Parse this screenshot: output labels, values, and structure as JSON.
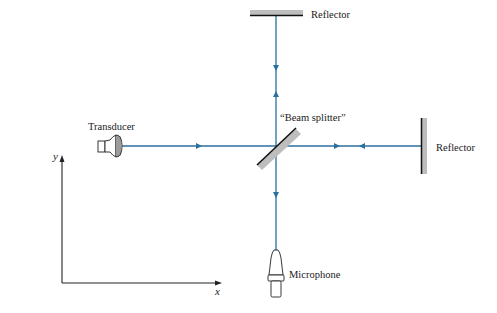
{
  "diagram": {
    "labels": {
      "top_reflector": "Reflector",
      "right_reflector": "Reflector",
      "beam_splitter": "“Beam splitter”",
      "transducer": "Transducer",
      "microphone": "Microphone",
      "x_axis": "x",
      "y_axis": "y"
    },
    "colors": {
      "beam": "#2b6f9e",
      "reflector_face": "#111111",
      "reflector_body": "#bdbdbd",
      "outline": "#222222"
    },
    "nodes": [
      {
        "id": "transducer",
        "label": "Transducer"
      },
      {
        "id": "beam_splitter",
        "label": "“Beam splitter”"
      },
      {
        "id": "top_reflector",
        "label": "Reflector"
      },
      {
        "id": "right_reflector",
        "label": "Reflector"
      },
      {
        "id": "microphone",
        "label": "Microphone"
      }
    ],
    "edges": [
      {
        "from": "transducer",
        "to": "beam_splitter",
        "direction": "right"
      },
      {
        "from": "beam_splitter",
        "to": "right_reflector",
        "direction": "right"
      },
      {
        "from": "right_reflector",
        "to": "beam_splitter",
        "direction": "left"
      },
      {
        "from": "beam_splitter",
        "to": "top_reflector",
        "direction": "up"
      },
      {
        "from": "top_reflector",
        "to": "beam_splitter",
        "direction": "down"
      },
      {
        "from": "beam_splitter",
        "to": "microphone",
        "direction": "down"
      }
    ]
  }
}
